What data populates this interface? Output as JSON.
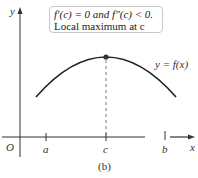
{
  "figure": {
    "caption": "(b)",
    "annotation": {
      "line1": "f′(c) = 0 and f″(c) < 0.",
      "line2": "Local maximum at c"
    },
    "curve_label": "y = f(x)",
    "axes": {
      "x_label": "x",
      "y_label": "y",
      "origin_label": "O"
    },
    "ticks": [
      {
        "label": "a"
      },
      {
        "label": "c"
      },
      {
        "label": "b"
      }
    ],
    "colors": {
      "curve": "#222222",
      "axis": "#333333",
      "point": "#333333",
      "box_border": "#c8c8c8"
    }
  }
}
